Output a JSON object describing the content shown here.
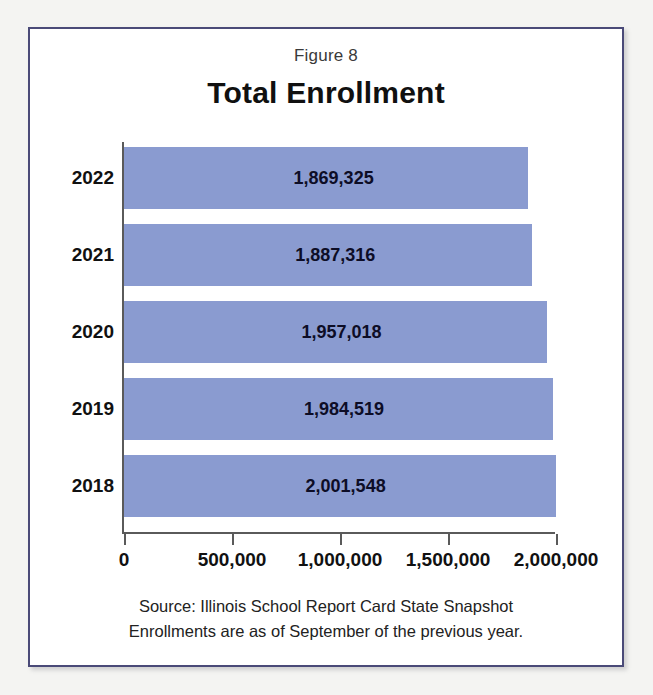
{
  "figure": {
    "caption": "Figure 8",
    "title": "Total Enrollment",
    "source_line_1": "Source: Illinois School Report Card State Snapshot",
    "source_line_2": "Enrollments are as of September of the previous year.",
    "frame_color": "#4a4a78",
    "bar_color": "#8a9bd0"
  },
  "chart_data": {
    "type": "bar",
    "orientation": "horizontal",
    "title": "Total Enrollment",
    "subtitle": "Figure 8",
    "xlabel": "",
    "ylabel": "",
    "categories": [
      "2022",
      "2021",
      "2020",
      "2019",
      "2018"
    ],
    "values": [
      1869325,
      1887316,
      1957018,
      1984519,
      2001548
    ],
    "value_labels": [
      "1,869,325",
      "1,887,316",
      "1,957,018",
      "1,984,519",
      "2,001,548"
    ],
    "xlim": [
      0,
      2000000
    ],
    "xticks": [
      0,
      500000,
      1000000,
      1500000,
      2000000
    ],
    "xtick_labels": [
      "0",
      "500,000",
      "1,000,000",
      "1,500,000",
      "2,000,000"
    ],
    "grid": false,
    "legend": false,
    "series": [
      {
        "name": "Total Enrollment",
        "values": [
          1869325,
          1887316,
          1957018,
          1984519,
          2001548
        ]
      }
    ],
    "annotations": [
      "Source: Illinois School Report Card State Snapshot",
      "Enrollments are as of September of the previous year."
    ]
  }
}
